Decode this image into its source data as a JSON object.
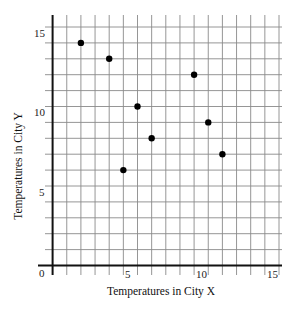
{
  "chart_data": {
    "type": "scatter",
    "title": "",
    "xlabel": "Temperatures in City X",
    "ylabel": "Temperatures in City Y",
    "xlim": [
      0,
      15
    ],
    "ylim": [
      0,
      15
    ],
    "x_ticks": [
      0,
      5,
      10,
      15
    ],
    "y_ticks": [
      5,
      10,
      15
    ],
    "grid": true,
    "grid_step": 1,
    "legend": null,
    "points": [
      {
        "x": 2,
        "y": 14
      },
      {
        "x": 4,
        "y": 13
      },
      {
        "x": 5,
        "y": 6
      },
      {
        "x": 6,
        "y": 10
      },
      {
        "x": 7,
        "y": 8
      },
      {
        "x": 10,
        "y": 12
      },
      {
        "x": 11,
        "y": 9
      },
      {
        "x": 12,
        "y": 7
      }
    ],
    "x": [
      2,
      4,
      5,
      6,
      7,
      10,
      11,
      12
    ],
    "y": [
      14,
      13,
      6,
      10,
      8,
      12,
      9,
      7
    ]
  },
  "labels": {
    "xlabel": "Temperatures in City X",
    "ylabel": "Temperatures in City Y",
    "origin": "0",
    "x5": "5",
    "x10": "10",
    "x15": "15",
    "y5": "5",
    "y10": "10",
    "y15": "15"
  },
  "colors": {
    "grid": "#8a8a8a",
    "axis": "#111111",
    "point": "#000000"
  }
}
